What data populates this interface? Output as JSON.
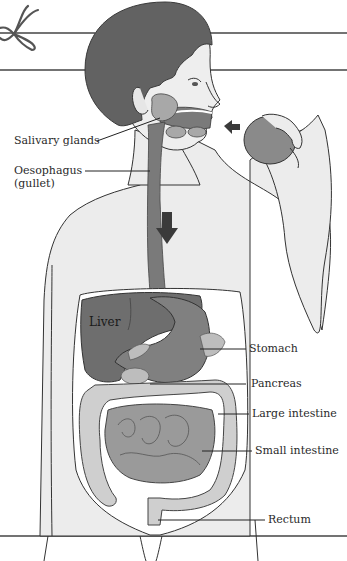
{
  "diagram": {
    "labels": {
      "salivary_glands": "Salivary glands",
      "oesophagus": "Oesophagus",
      "oesophagus_alt": "(gullet)",
      "liver": "Liver",
      "stomach": "Stomach",
      "pancreas": "Pancreas",
      "large_intestine": "Large intestine",
      "small_intestine": "Small intestine",
      "rectum": "Rectum"
    },
    "colors": {
      "skin": "#e9e9e9",
      "hair": "#5f5f5f",
      "organ_dark": "#6e6e6e",
      "organ_mid": "#8c8c8c",
      "intestine_light": "#c8c8c8",
      "arrow": "#3a3a3a",
      "outline": "#333333",
      "background": "#ffffff"
    }
  }
}
